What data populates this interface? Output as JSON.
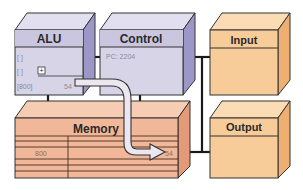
{
  "diagram": {
    "type": "computer-architecture-block-diagram",
    "blocks": {
      "alu": {
        "label": "ALU",
        "registers": [
          "[        ]",
          "[        ]",
          "[800]"
        ],
        "plus_symbol": "+",
        "output_value": "54"
      },
      "control": {
        "label": "Control",
        "pc_text": "PC: 2204"
      },
      "input": {
        "label": "Input"
      },
      "memory": {
        "label": "Memory",
        "address": "800",
        "target_value": "54"
      },
      "output": {
        "label": "Output"
      }
    },
    "colors": {
      "cpu_front": "#d8d4e8",
      "cpu_header": "#cbc6e0",
      "cpu_side": "#9d97c8",
      "cpu_top": "#e2dff0",
      "memory_front": "#f0b898",
      "memory_side": "#e49a78",
      "memory_top": "#f6cdb2",
      "io_front": "#f8cc98",
      "io_side": "#eeb070",
      "io_top": "#fbdcb4",
      "line": "#1a1a1a"
    }
  }
}
